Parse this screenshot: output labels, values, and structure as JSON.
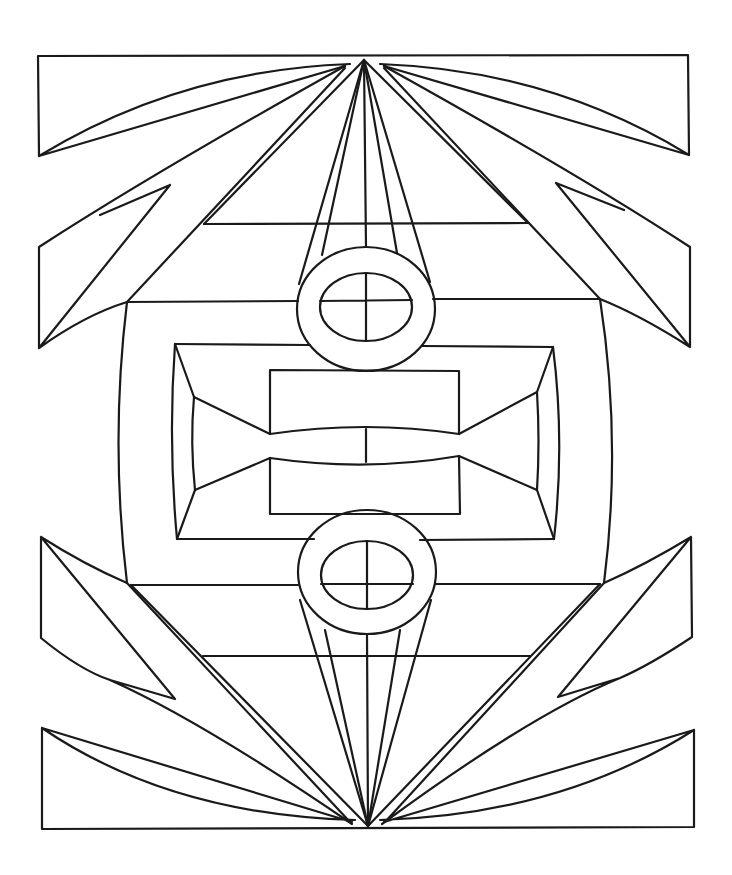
{
  "artwork": {
    "type": "geometric line-art coloring page",
    "background": "#ffffff",
    "stroke": "#1a1a1a",
    "apex_top": [
      364,
      58
    ],
    "apex_bottom": [
      368,
      827
    ],
    "center_x": 366,
    "top_ring": {
      "cx": 366,
      "cy": 309,
      "rx": 69,
      "ry": 62,
      "inner_rx": 46,
      "inner_ry": 34,
      "inner_cy": 306
    },
    "bottom_ring": {
      "cx": 367,
      "cy": 572,
      "rx": 69,
      "ry": 62,
      "inner_rx": 46,
      "inner_ry": 34,
      "inner_cy": 575
    },
    "center_frame": {
      "x1": 175,
      "y1": 344,
      "x2": 553,
      "y2": 539
    },
    "inner_rects": [
      {
        "x": 270,
        "y": 370,
        "w": 189,
        "h": 62
      },
      {
        "x": 270,
        "y": 454,
        "w": 189,
        "h": 60
      }
    ]
  }
}
